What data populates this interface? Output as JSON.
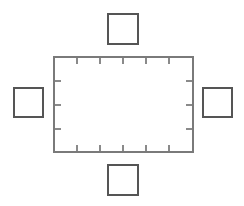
{
  "figure": {
    "title": "",
    "width": 244,
    "height": 206,
    "background": "#ffffff"
  },
  "diagram_data": {
    "type": "line-diagram",
    "description": "Central tick-marked rectangle surrounded by four small squares at top, bottom, left and right",
    "colors": {
      "central_rectangle_stroke": "#7a7a7a",
      "tick_stroke": "#8a8a8a",
      "outer_square_stroke": "#555555",
      "background": "#ffffff"
    },
    "central_rectangle": {
      "name": "central-rectangle",
      "x": 54,
      "y": 57,
      "width": 139,
      "height": 95,
      "stroke": "#7a7a7a",
      "stroke_width": 1.2,
      "fill": "none"
    },
    "ticks": {
      "length": 7,
      "stroke": "#8a8a8a",
      "stroke_width": 1.2,
      "top": {
        "count": 5,
        "positions": [
          77,
          100,
          123,
          146,
          169
        ],
        "direction": "inward-down"
      },
      "bottom": {
        "count": 5,
        "positions": [
          77,
          100,
          123,
          146,
          169
        ],
        "direction": "inward-up"
      },
      "left": {
        "count": 3,
        "positions": [
          81,
          105,
          129
        ],
        "direction": "inward-right"
      },
      "right": {
        "count": 3,
        "positions": [
          81,
          105,
          129
        ],
        "direction": "inward-left"
      }
    },
    "outer_squares": [
      {
        "name": "top-square",
        "position": "top",
        "x": 108,
        "y": 14,
        "width": 30,
        "height": 30,
        "stroke": "#555555",
        "stroke_width": 1.6,
        "fill": "none"
      },
      {
        "name": "left-square",
        "position": "left",
        "x": 14,
        "y": 88,
        "width": 29,
        "height": 29,
        "stroke": "#555555",
        "stroke_width": 1.6,
        "fill": "none"
      },
      {
        "name": "right-square",
        "position": "right",
        "x": 203,
        "y": 88,
        "width": 29,
        "height": 29,
        "stroke": "#555555",
        "stroke_width": 1.6,
        "fill": "none"
      },
      {
        "name": "bottom-square",
        "position": "bottom",
        "x": 108,
        "y": 165,
        "width": 30,
        "height": 30,
        "stroke": "#555555",
        "stroke_width": 1.6,
        "fill": "none"
      }
    ]
  }
}
